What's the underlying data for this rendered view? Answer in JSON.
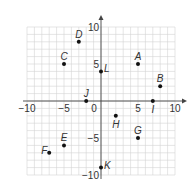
{
  "chart_data": {
    "type": "scatter",
    "title": "",
    "xlabel": "",
    "ylabel": "",
    "xlim": [
      -10,
      10
    ],
    "ylim": [
      -10,
      10
    ],
    "grid": true,
    "grid_step": 1,
    "tick_labels": {
      "x": [
        {
          "value": -10,
          "label": "−10"
        },
        {
          "value": -5,
          "label": "−5"
        },
        {
          "value": 0,
          "label": "0"
        },
        {
          "value": 5,
          "label": "5"
        },
        {
          "value": 10,
          "label": "10"
        }
      ],
      "y": [
        {
          "value": 10,
          "label": "10"
        },
        {
          "value": 5,
          "label": "5"
        },
        {
          "value": -5,
          "label": "−5"
        },
        {
          "value": -10,
          "label": "−10"
        }
      ]
    },
    "points": [
      {
        "label": "A",
        "x": 5,
        "y": 5,
        "lx": -1,
        "ly": -4
      },
      {
        "label": "B",
        "x": 8,
        "y": 2,
        "lx": -1,
        "ly": -4
      },
      {
        "label": "C",
        "x": -5,
        "y": 5,
        "lx": -1,
        "ly": -4
      },
      {
        "label": "D",
        "x": -3,
        "y": 8,
        "lx": -1,
        "ly": -4
      },
      {
        "label": "E",
        "x": -5,
        "y": -6,
        "lx": -1,
        "ly": -4
      },
      {
        "label": "F",
        "x": -7,
        "y": -7,
        "lx": -8,
        "ly": 1
      },
      {
        "label": "G",
        "x": 5,
        "y": -5,
        "lx": -1,
        "ly": -4
      },
      {
        "label": "H",
        "x": 2,
        "y": -2,
        "lx": -1,
        "ly": 5
      },
      {
        "label": "I",
        "x": 7,
        "y": 0,
        "lx": -1,
        "ly": 5
      },
      {
        "label": "J",
        "x": -2,
        "y": 0,
        "lx": -1,
        "ly": -4
      },
      {
        "label": "K",
        "x": 0,
        "y": -9,
        "lx": 3,
        "ly": 1
      },
      {
        "label": "L",
        "x": 0,
        "y": 4,
        "lx": 3,
        "ly": 1
      }
    ]
  },
  "colors": {
    "grid": "#d4d4d4",
    "axis": "#444444",
    "point": "#111111",
    "text": "#333333"
  }
}
